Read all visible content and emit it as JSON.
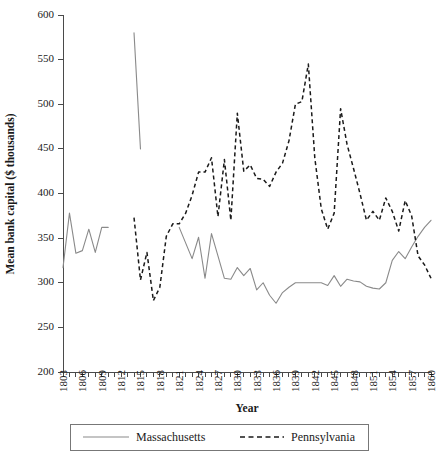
{
  "chart_data": {
    "type": "line",
    "title": "",
    "xlabel": "Year",
    "ylabel": "Mean bank capital ($ thousands)",
    "xlim": [
      1803,
      1860
    ],
    "ylim": [
      200,
      600
    ],
    "ytick_values": [
      200,
      250,
      300,
      350,
      400,
      450,
      500,
      550,
      600
    ],
    "ytick_labels": [
      "200",
      "250",
      "300",
      "350",
      "400",
      "450",
      "500",
      "550",
      "600"
    ],
    "xtick_labels": [
      "1803",
      "1806",
      "1809",
      "1812",
      "1815",
      "1818",
      "1821",
      "1824",
      "1827",
      "1830",
      "1833",
      "1836",
      "1839",
      "1842",
      "1845",
      "1848",
      "1851",
      "1854",
      "1857",
      "1860"
    ],
    "xtick_label_step": 3,
    "xtick_minor_every": 1,
    "grid": false,
    "legend_position": "bottom",
    "series": [
      {
        "name": "Massachusetts",
        "style": "solid",
        "color": "#8a8a8a",
        "segments": [
          {
            "x": [
              1803,
              1804,
              1805,
              1806,
              1807,
              1808,
              1809,
              1810
            ],
            "y": [
              317,
              378,
              333,
              336,
              360,
              334,
              362,
              362
            ]
          },
          {
            "x": [
              1814,
              1815
            ],
            "y": [
              580,
              450
            ]
          },
          {
            "x": [
              1821,
              1823,
              1824,
              1825,
              1826,
              1827,
              1828,
              1829,
              1830,
              1831,
              1832,
              1833,
              1834,
              1835,
              1836,
              1837,
              1838,
              1839,
              1840,
              1841,
              1842,
              1843,
              1844,
              1845,
              1846,
              1847,
              1848,
              1849,
              1850,
              1851,
              1852,
              1853,
              1854,
              1855,
              1856,
              1857,
              1858,
              1859,
              1860
            ],
            "y": [
              362,
              327,
              351,
              305,
              355,
              330,
              305,
              304,
              317,
              308,
              316,
              292,
              300,
              286,
              277,
              289,
              295,
              300,
              300,
              300,
              300,
              300,
              297,
              308,
              296,
              304,
              302,
              301,
              296,
              294,
              293,
              300,
              325,
              335,
              327,
              340,
              352,
              362,
              370
            ]
          }
        ]
      },
      {
        "name": "Pennsylvania",
        "style": "dashed",
        "color": "#1a1a1a",
        "segments": [
          {
            "x": [
              1814,
              1815,
              1816,
              1817,
              1818,
              1819,
              1820,
              1821,
              1822,
              1823,
              1824,
              1825,
              1826,
              1827,
              1828,
              1829,
              1830,
              1831,
              1832,
              1833,
              1834,
              1835,
              1836,
              1837,
              1838,
              1839,
              1840,
              1841,
              1842,
              1843,
              1844,
              1845,
              1846,
              1847,
              1848,
              1849,
              1850,
              1851,
              1852,
              1853,
              1854,
              1855,
              1856,
              1857,
              1858,
              1859,
              1860
            ],
            "y": [
              373,
              303,
              334,
              280,
              295,
              352,
              366,
              366,
              378,
              398,
              424,
              424,
              440,
              374,
              438,
              370,
              490,
              425,
              432,
              417,
              416,
              408,
              424,
              434,
              459,
              500,
              503,
              545,
              440,
              383,
              360,
              378,
              495,
              455,
              428,
              400,
              370,
              380,
              370,
              395,
              380,
              358,
              392,
              375,
              330,
              320,
              305
            ]
          }
        ]
      }
    ]
  },
  "legend": {
    "entries": [
      {
        "label": "Massachusetts",
        "style": "solid"
      },
      {
        "label": "Pennsylvania",
        "style": "dashed"
      }
    ]
  }
}
